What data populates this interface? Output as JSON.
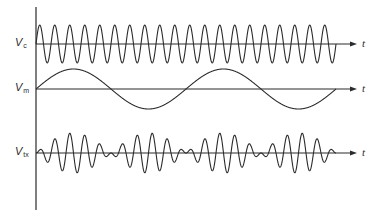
{
  "diagram": {
    "title": "",
    "stroke_color": "#2b2b2b",
    "background": "#ffffff",
    "vertical_axis": {
      "x": 36,
      "y_top": 7,
      "y_bottom": 210
    },
    "time_axis_label": "t",
    "rows": [
      {
        "id": "carrier",
        "label_main": "V",
        "label_sub": "c",
        "axis_y": 44,
        "label_x": 15,
        "label_y": 37,
        "arrow_end_x": 357,
        "t_label_x": 362,
        "t_label_y": 38
      },
      {
        "id": "modulating",
        "label_main": "V",
        "label_sub": "m",
        "axis_y": 89,
        "label_x": 15,
        "label_y": 82,
        "arrow_end_x": 357,
        "t_label_x": 362,
        "t_label_y": 83
      },
      {
        "id": "transmitted",
        "label_main": "V",
        "label_sub": "tx",
        "axis_y": 153,
        "label_x": 15,
        "label_y": 146,
        "arrow_end_x": 357,
        "t_label_x": 362,
        "t_label_y": 147
      }
    ]
  },
  "chart_data": {
    "type": "line",
    "xlabel": "t",
    "ylabel": "",
    "grid": false,
    "x_range_px": [
      36,
      336
    ],
    "series": [
      {
        "name": "Vc (carrier)",
        "kind": "sine",
        "amplitude_px": 19,
        "cycles": 20,
        "phase": 0
      },
      {
        "name": "Vm (modulating)",
        "kind": "sine",
        "amplitude_px": 20,
        "cycles": 2,
        "phase": 0
      },
      {
        "name": "Vtx (transmitted)",
        "kind": "product",
        "of": [
          "Vm (modulating)",
          "Vc (carrier)"
        ],
        "amplitude_px": 20,
        "envelope_nulls_px": [
          36,
          111,
          186,
          261,
          336
        ]
      }
    ]
  }
}
